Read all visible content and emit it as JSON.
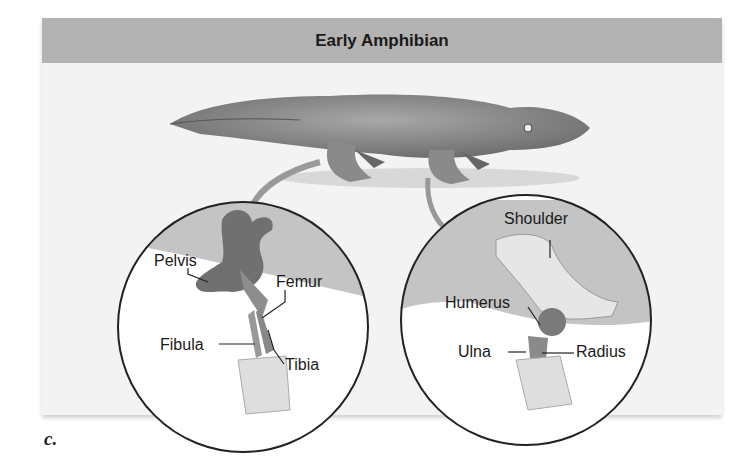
{
  "figure": {
    "title": "Early Amphibian",
    "panel_letter": "c.",
    "hindlimb_inset": {
      "labels": [
        "Pelvis",
        "Femur",
        "Fibula",
        "Tibia"
      ]
    },
    "forelimb_inset": {
      "labels": [
        "Shoulder",
        "Humerus",
        "Ulna",
        "Radius"
      ]
    },
    "colors": {
      "header_bg": "#b3b3b3",
      "panel_bg": "#f3f3f3",
      "bone_dark": "#707070",
      "bone_light": "#e6e6e6"
    }
  }
}
